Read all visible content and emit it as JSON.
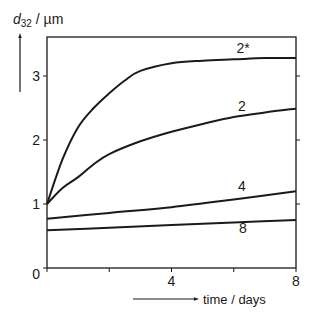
{
  "chart_data": {
    "type": "line",
    "title": "",
    "xlabel": "time / days",
    "ylabel": "d32 / µm",
    "ylabel_main": "d",
    "ylabel_sub": "32",
    "ylabel_unit": " / µm",
    "xlim": [
      0,
      8
    ],
    "ylim": [
      0,
      3.5
    ],
    "xticks": [
      0,
      2,
      4,
      6,
      8
    ],
    "xtick_labels": [
      "0",
      "",
      "4",
      "",
      "8"
    ],
    "yticks": [
      0,
      1,
      2,
      3
    ],
    "ytick_labels": [
      "0",
      "1",
      "2",
      "3"
    ],
    "grid": false,
    "legend": "inline labels at right end of curves",
    "series": [
      {
        "name": "2*",
        "x": [
          0,
          0.5,
          1,
          1.5,
          2,
          2.5,
          3,
          4,
          5,
          6,
          7,
          8
        ],
        "values": [
          1.0,
          1.7,
          2.2,
          2.5,
          2.73,
          2.93,
          3.08,
          3.2,
          3.24,
          3.26,
          3.28,
          3.28
        ]
      },
      {
        "name": "2",
        "x": [
          0,
          0.5,
          1,
          1.5,
          2,
          3,
          4,
          5,
          6,
          7,
          8
        ],
        "values": [
          1.0,
          1.25,
          1.42,
          1.62,
          1.78,
          1.98,
          2.13,
          2.25,
          2.36,
          2.43,
          2.49
        ]
      },
      {
        "name": "4",
        "x": [
          0,
          2,
          4,
          6,
          8
        ],
        "values": [
          0.77,
          0.86,
          0.95,
          1.07,
          1.2
        ]
      },
      {
        "name": "8",
        "x": [
          0,
          2,
          4,
          6,
          8
        ],
        "values": [
          0.59,
          0.63,
          0.67,
          0.71,
          0.75
        ]
      }
    ]
  }
}
